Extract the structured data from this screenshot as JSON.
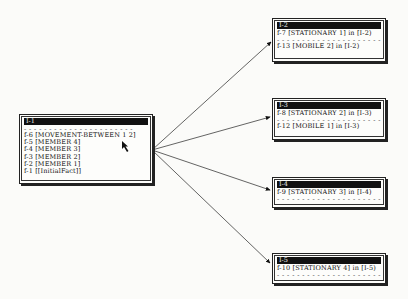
{
  "source_window": {
    "title": "I-1",
    "separator": "- - - - - - - - - - - - - - - - - - - - - -",
    "facts": [
      "f-6 [MOVEMENT-BETWEEN 1 2]",
      "f-5 [MEMBER 4]",
      "f-4 [MEMBER 3]",
      "f-3 [MEMBER 2]",
      "f-2 [MEMBER 1]",
      "f-1 [[InitialFact]]"
    ]
  },
  "target_windows": [
    {
      "title": "I-2",
      "top_facts": [
        "f-7 [STATIONARY 1] in [I-2)"
      ],
      "separator": "- - - - - - - - - - - - - - - - - - - - -",
      "bottom_facts": [
        "f-13 [MOBILE 2] in [I-2)"
      ]
    },
    {
      "title": "I-3",
      "top_facts": [
        "f-8 [STATIONARY 2] in [I-3)"
      ],
      "separator": "- - - - - - - - - - - - - - - - - - - - -",
      "bottom_facts": [
        "f-12 [MOBILE 1] in [I-3)"
      ]
    },
    {
      "title": "I-4",
      "top_facts": [
        "f-9 [STATIONARY 3] in [I-4)"
      ],
      "separator": "- - - - - - - - - - - - - - - - - - - - -",
      "bottom_facts": []
    },
    {
      "title": "I-5",
      "top_facts": [
        "f-10 [STATIONARY 4] in [I-5)"
      ],
      "separator": "- - - - - - - - - - - - - - - - - - - - -",
      "bottom_facts": []
    }
  ],
  "edges": [
    {
      "from": "I-1",
      "to": "I-2"
    },
    {
      "from": "I-1",
      "to": "I-3"
    },
    {
      "from": "I-1",
      "to": "I-4"
    },
    {
      "from": "I-1",
      "to": "I-5"
    }
  ]
}
